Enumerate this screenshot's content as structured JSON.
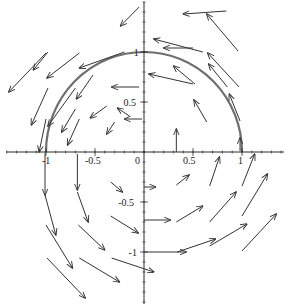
{
  "chart_data": {
    "type": "quiver",
    "title": "",
    "xlabel": "",
    "ylabel": "",
    "xlim": [
      -1.45,
      1.45
    ],
    "ylim": [
      -1.5,
      1.5
    ],
    "grid": false,
    "x_ticks": [
      {
        "value": -1,
        "label": "-1"
      },
      {
        "value": -0.5,
        "label": "-0.5"
      },
      {
        "value": 0,
        "label": "0"
      },
      {
        "value": 0.5,
        "label": "0.5"
      },
      {
        "value": 1,
        "label": "1"
      }
    ],
    "y_ticks": [
      {
        "value": 1,
        "label": "1"
      },
      {
        "value": 0.5,
        "label": "0.5"
      },
      {
        "value": -0.5,
        "label": "-0.5"
      },
      {
        "value": -1,
        "label": "-1"
      }
    ],
    "curve": {
      "name": "semicircle trajectory",
      "description": "upper unit semicircle from (1,0) to (-1,0)",
      "radius": 1,
      "color": "#6e6e6e"
    },
    "vectors": [
      {
        "x0": -0.05,
        "y0": 1.45,
        "x1": -0.24,
        "y1": 1.26
      },
      {
        "x0": -0.2,
        "y0": 1.0,
        "x1": -0.66,
        "y1": 0.84
      },
      {
        "x0": -0.98,
        "y0": 1.0,
        "x1": -1.13,
        "y1": 0.82
      },
      {
        "x0": -0.66,
        "y0": 0.99,
        "x1": -0.99,
        "y1": 0.74
      },
      {
        "x0": -1.0,
        "y0": 0.99,
        "x1": -1.38,
        "y1": 0.6
      },
      {
        "x0": -0.52,
        "y0": 0.77,
        "x1": -0.69,
        "y1": 0.53
      },
      {
        "x0": -0.05,
        "y0": 0.65,
        "x1": -0.33,
        "y1": 0.65
      },
      {
        "x0": -0.02,
        "y0": 0.33,
        "x1": -0.2,
        "y1": 0.33
      },
      {
        "x0": -0.38,
        "y0": 0.46,
        "x1": -0.55,
        "y1": 0.34
      },
      {
        "x0": -0.7,
        "y0": 0.43,
        "x1": -0.84,
        "y1": 0.2
      },
      {
        "x0": -0.7,
        "y0": 0.64,
        "x1": -0.98,
        "y1": 0.26
      },
      {
        "x0": -0.98,
        "y0": 0.64,
        "x1": -1.15,
        "y1": 0.27
      },
      {
        "x0": -0.66,
        "y0": 0.33,
        "x1": -0.78,
        "y1": 0.07
      },
      {
        "x0": -0.3,
        "y0": 0.3,
        "x1": -0.38,
        "y1": 0.18
      },
      {
        "x0": -1.0,
        "y0": 0.33,
        "x1": -1.07,
        "y1": 0.0
      },
      {
        "x0": 0.84,
        "y0": 1.41,
        "x1": 0.4,
        "y1": 1.38
      },
      {
        "x0": 0.5,
        "y0": 1.04,
        "x1": 0.2,
        "y1": 1.04
      },
      {
        "x0": 0.96,
        "y0": 1.01,
        "x1": 0.64,
        "y1": 1.38
      },
      {
        "x0": 0.6,
        "y0": 1.0,
        "x1": 0.1,
        "y1": 1.13
      },
      {
        "x0": 0.85,
        "y0": 0.65,
        "x1": 0.66,
        "y1": 0.88
      },
      {
        "x0": 0.97,
        "y0": 0.65,
        "x1": 0.65,
        "y1": 0.99
      },
      {
        "x0": 0.5,
        "y0": 0.68,
        "x1": 0.05,
        "y1": 0.78
      },
      {
        "x0": 0.52,
        "y0": 0.68,
        "x1": 0.3,
        "y1": 0.86
      },
      {
        "x0": 0.98,
        "y0": 0.31,
        "x1": 0.87,
        "y1": 0.58
      },
      {
        "x0": 0.64,
        "y0": 0.3,
        "x1": 0.51,
        "y1": 0.52
      },
      {
        "x0": 0.98,
        "y0": 0.01,
        "x1": 0.98,
        "y1": 0.14
      },
      {
        "x0": 0.33,
        "y0": 0.0,
        "x1": 0.33,
        "y1": 0.23
      },
      {
        "x0": -0.15,
        "y0": 0.36,
        "x1": -0.27,
        "y1": 0.44
      },
      {
        "x0": 0.0,
        "y0": 0.0,
        "x1": 0.0,
        "y1": 0.0
      },
      {
        "x0": -0.34,
        "y0": -0.3,
        "x1": -0.22,
        "y1": -0.4
      },
      {
        "x0": -0.68,
        "y0": -0.02,
        "x1": -0.68,
        "y1": -0.38
      },
      {
        "x0": -0.68,
        "y0": -0.4,
        "x1": -0.57,
        "y1": -0.7
      },
      {
        "x0": -1.01,
        "y0": -0.01,
        "x1": -1.01,
        "y1": -0.43
      },
      {
        "x0": -1.01,
        "y0": -0.43,
        "x1": -0.9,
        "y1": -0.83
      },
      {
        "x0": -1.0,
        "y0": -0.73,
        "x1": -0.73,
        "y1": -1.16
      },
      {
        "x0": -0.67,
        "y0": -0.73,
        "x1": -0.4,
        "y1": -0.98
      },
      {
        "x0": -0.34,
        "y0": -0.64,
        "x1": -0.06,
        "y1": -0.81
      },
      {
        "x0": -0.66,
        "y0": -1.06,
        "x1": -0.25,
        "y1": -1.3
      },
      {
        "x0": -0.99,
        "y0": -1.06,
        "x1": -0.6,
        "y1": -1.46
      },
      {
        "x0": -0.33,
        "y0": -1.06,
        "x1": 0.1,
        "y1": -1.2
      },
      {
        "x0": 0.0,
        "y0": -0.35,
        "x1": 0.12,
        "y1": -0.35
      },
      {
        "x0": 0.0,
        "y0": -0.68,
        "x1": 0.27,
        "y1": -0.68
      },
      {
        "x0": 0.0,
        "y0": -1.0,
        "x1": 0.43,
        "y1": -1.0
      },
      {
        "x0": 0.33,
        "y0": -0.33,
        "x1": 0.46,
        "y1": -0.23
      },
      {
        "x0": 0.33,
        "y0": -0.7,
        "x1": 0.6,
        "y1": -0.54
      },
      {
        "x0": 0.34,
        "y0": -1.0,
        "x1": 0.73,
        "y1": -0.87
      },
      {
        "x0": 0.67,
        "y0": -0.34,
        "x1": 0.77,
        "y1": -0.05
      },
      {
        "x0": 0.67,
        "y0": -0.7,
        "x1": 0.94,
        "y1": -0.4
      },
      {
        "x0": 0.67,
        "y0": -0.94,
        "x1": 1.05,
        "y1": -0.72
      },
      {
        "x0": 1.0,
        "y0": -0.34,
        "x1": 1.13,
        "y1": -0.02
      },
      {
        "x0": 1.0,
        "y0": -0.64,
        "x1": 1.26,
        "y1": -0.22
      },
      {
        "x0": 1.0,
        "y0": -0.99,
        "x1": 1.35,
        "y1": -0.62
      }
    ]
  }
}
